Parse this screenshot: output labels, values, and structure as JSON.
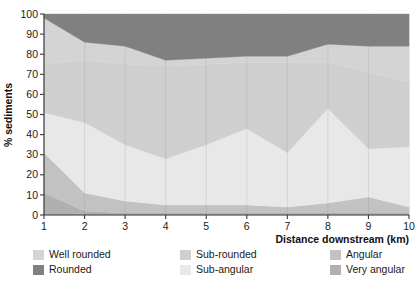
{
  "chart_data": {
    "type": "area",
    "stacked": true,
    "percent": true,
    "title": "",
    "xlabel": "Distance downstream (km)",
    "ylabel": "% sediments",
    "xlim": [
      1,
      10
    ],
    "ylim": [
      0,
      100
    ],
    "grid": "vertical",
    "legend_position": "below",
    "x": [
      1,
      2,
      3,
      4,
      5,
      6,
      7,
      8,
      9,
      10
    ],
    "xticklabels": [
      "1",
      "2",
      "3",
      "4",
      "5",
      "6",
      "7",
      "8",
      "9",
      "10"
    ],
    "yticklabels": [
      "0",
      "10",
      "20",
      "30",
      "40",
      "50",
      "60",
      "70",
      "80",
      "90",
      "100"
    ],
    "yticks": [
      0,
      10,
      20,
      30,
      40,
      50,
      60,
      70,
      80,
      90,
      100
    ],
    "stack_order_bottom_to_top": [
      "Very angular",
      "Angular",
      "Sub-angular",
      "Sub-rounded",
      "Well rounded",
      "Rounded"
    ],
    "series": [
      {
        "name": "Very angular",
        "color": "#b0b0b0",
        "values": [
          11,
          2,
          1,
          1,
          1,
          1,
          1,
          1,
          1,
          1
        ]
      },
      {
        "name": "Angular",
        "color": "#c2c2c2",
        "values": [
          20,
          9,
          6,
          4,
          4,
          4,
          3,
          5,
          8,
          3
        ]
      },
      {
        "name": "Sub-angular",
        "color": "#e8e8e8",
        "values": [
          20,
          35,
          28,
          23,
          30,
          38,
          27,
          47,
          24,
          30
        ]
      },
      {
        "name": "Sub-rounded",
        "color": "#cfcfcf",
        "values": [
          24,
          31,
          40,
          46,
          40,
          33,
          45,
          23,
          38,
          32
        ]
      },
      {
        "name": "Well rounded",
        "color": "#d4d4d4",
        "values": [
          23,
          9,
          9,
          3,
          3,
          3,
          3,
          9,
          13,
          18
        ]
      },
      {
        "name": "Rounded",
        "color": "#808080",
        "values": [
          2,
          14,
          16,
          23,
          22,
          21,
          21,
          15,
          16,
          16
        ]
      }
    ],
    "cumulative_upper_boundaries": {
      "very_angular": [
        11,
        2,
        1,
        1,
        1,
        1,
        1,
        1,
        1,
        1
      ],
      "angular": [
        31,
        11,
        7,
        5,
        5,
        5,
        4,
        6,
        9,
        4
      ],
      "sub_angular": [
        51,
        46,
        35,
        28,
        35,
        43,
        31,
        53,
        33,
        34
      ],
      "sub_rounded": [
        75,
        77,
        75,
        74,
        75,
        76,
        76,
        76,
        71,
        66
      ],
      "well_rounded": [
        98,
        86,
        84,
        77,
        78,
        79,
        79,
        85,
        84,
        84
      ],
      "rounded": [
        100,
        100,
        100,
        100,
        100,
        100,
        100,
        100,
        100,
        100
      ]
    }
  },
  "axes": {
    "y_title": "% sediments",
    "x_title": "Distance downstream (km)"
  },
  "legend": {
    "columns": [
      {
        "entries": [
          {
            "label": "Well rounded",
            "color": "#d4d4d4"
          },
          {
            "label": "Rounded",
            "color": "#808080"
          }
        ]
      },
      {
        "entries": [
          {
            "label": "Sub-rounded",
            "color": "#cfcfcf"
          },
          {
            "label": "Sub-angular",
            "color": "#e8e8e8"
          }
        ]
      },
      {
        "entries": [
          {
            "label": "Angular",
            "color": "#c2c2c2"
          },
          {
            "label": "Very angular",
            "color": "#b0b0b0"
          }
        ]
      }
    ]
  }
}
